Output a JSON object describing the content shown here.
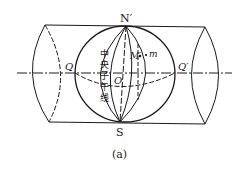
{
  "figure": {
    "caption": "(a)",
    "labels": {
      "north_pole": "N′",
      "south_pole": "S",
      "left_point": "Q",
      "right_point": "Q′",
      "center": "O",
      "point_globe": "M′",
      "point_projected": "m",
      "central_meridian_text": [
        "中",
        "央",
        "子",
        "午",
        "线"
      ]
    },
    "colors": {
      "line": "#1a1a1a",
      "background": "#ffffff"
    }
  }
}
